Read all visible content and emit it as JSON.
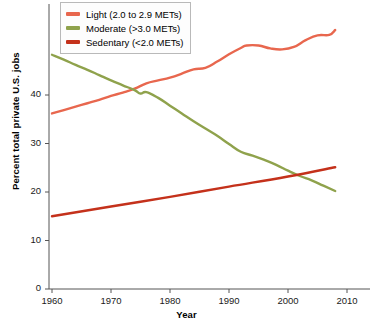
{
  "chart_data": {
    "type": "line",
    "title": "",
    "xlabel": "Year",
    "ylabel": "Percent total private U.S. jobs",
    "xlim": [
      1957,
      2012
    ],
    "ylim": [
      0,
      50
    ],
    "xticks": [
      1960,
      1970,
      1980,
      1990,
      2000,
      2010
    ],
    "yticks": [
      0,
      10,
      20,
      30,
      40
    ],
    "grid": false,
    "legend_position": "top-left",
    "series": [
      {
        "name": "Light (2.0 to 2.9 METs)",
        "color": "#E8674E",
        "x": [
          1960,
          1962,
          1964,
          1966,
          1968,
          1970,
          1972,
          1974,
          1976,
          1978,
          1980,
          1982,
          1984,
          1986,
          1988,
          1990,
          1992,
          1993,
          1995,
          1997,
          1999,
          2001,
          2003,
          2005,
          2007,
          2008
        ],
        "values": [
          36.2,
          36.9,
          37.6,
          38.3,
          39.0,
          39.8,
          40.5,
          41.3,
          42.4,
          43.0,
          43.6,
          44.4,
          45.3,
          45.6,
          46.9,
          48.4,
          49.7,
          50.2,
          50.2,
          49.6,
          49.4,
          49.9,
          51.3,
          52.3,
          52.4,
          53.4
        ]
      },
      {
        "name": "Moderate (>3.0 METs)",
        "color": "#8FA24C",
        "x": [
          1960,
          1962,
          1964,
          1966,
          1968,
          1970,
          1972,
          1974,
          1975,
          1976,
          1978,
          1980,
          1982,
          1984,
          1986,
          1988,
          1990,
          1992,
          1994,
          1996,
          1998,
          2000,
          2002,
          2004,
          2006,
          2008
        ],
        "values": [
          48.3,
          47.3,
          46.2,
          45.2,
          44.1,
          43.0,
          42.0,
          41.0,
          40.3,
          40.6,
          39.4,
          37.8,
          36.2,
          34.6,
          33.1,
          31.6,
          29.9,
          28.3,
          27.5,
          26.6,
          25.6,
          24.4,
          23.3,
          22.4,
          21.3,
          20.2
        ]
      },
      {
        "name": "Sedentary (<2.0 METs)",
        "color": "#C4311B",
        "x": [
          1960,
          1970,
          1980,
          1990,
          2000,
          2008
        ],
        "values": [
          15.0,
          17.0,
          19.0,
          21.1,
          23.2,
          25.1
        ]
      }
    ]
  },
  "legend": {
    "items": [
      {
        "label": "Light (2.0 to 2.9 METs)",
        "color": "#E8674E"
      },
      {
        "label": "Moderate (>3.0 METs)",
        "color": "#8FA24C"
      },
      {
        "label": "Sedentary (<2.0 METs)",
        "color": "#C4311B"
      }
    ]
  }
}
